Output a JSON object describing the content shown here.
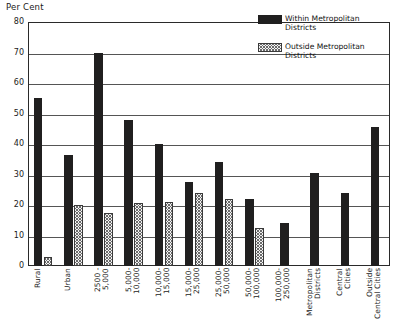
{
  "chart_data": {
    "type": "bar",
    "title": "",
    "xlabel": "",
    "ylabel": "Per Cent",
    "ylim": [
      0,
      80
    ],
    "yticks": [
      0,
      10,
      20,
      30,
      40,
      50,
      60,
      70,
      80
    ],
    "ytick_labels": [
      "0",
      "10",
      "20",
      "30",
      "40",
      "50",
      "60",
      "70",
      "80"
    ],
    "grid": true,
    "legend_position": "top-right",
    "categories": [
      "Rural",
      "Urban",
      "2500 -\n5,000",
      "5,000-\n10,000",
      "10,000-\n15,000",
      "15,000-\n25,000",
      "25,000-\n50,000",
      "50,000-\n100,000",
      "100,000-\n250,000",
      "Metropolitan\nDistricts",
      "Central\nCities",
      "Outside\nCentral Cities"
    ],
    "series": [
      {
        "name": "Within Metropolitan Districts",
        "style": "solid-black",
        "color": "#201f1f",
        "values": [
          55,
          36.5,
          70,
          48,
          40,
          27.5,
          34,
          22,
          14,
          30.5,
          24,
          45.5
        ]
      },
      {
        "name": "Outside Metropolitan Districts",
        "style": "hatched",
        "color": "#f2f2f2",
        "values": [
          3,
          20,
          17.5,
          20.5,
          21,
          24,
          22,
          12.5,
          null,
          null,
          null,
          null
        ]
      }
    ]
  },
  "legend": {
    "items": [
      {
        "label": "Within Metropolitan\nDistricts",
        "style": "solid"
      },
      {
        "label": "Outside Metropolitan\nDistricts",
        "style": "hatch"
      }
    ]
  },
  "axis": {
    "y_title": "Per Cent"
  }
}
